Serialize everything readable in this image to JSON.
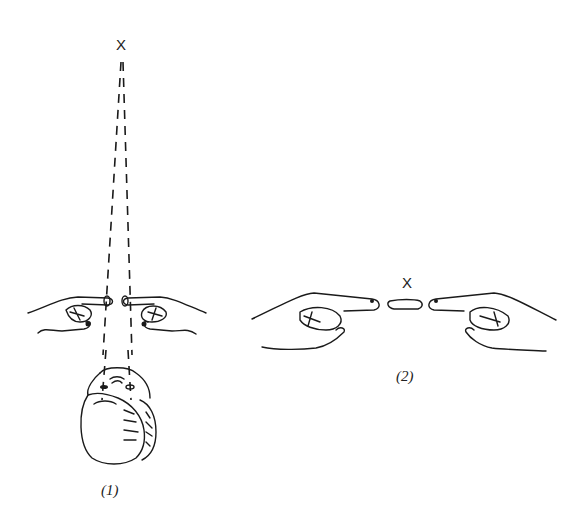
{
  "figure": {
    "panels": [
      {
        "id": "1",
        "label": "(1)",
        "target_marker": "X",
        "description": "Top view of head looking at distant X through a gap between two pointing index fingers; dashed sight lines from both eyes converge on X"
      },
      {
        "id": "2",
        "label": "(2)",
        "target_marker": "X",
        "description": "Front view of two hands with index fingers pointing toward each other, with a floating finger segment between the fingertips below the X"
      }
    ],
    "colors": {
      "ink": "#1a1a1a",
      "background": "#ffffff"
    }
  }
}
